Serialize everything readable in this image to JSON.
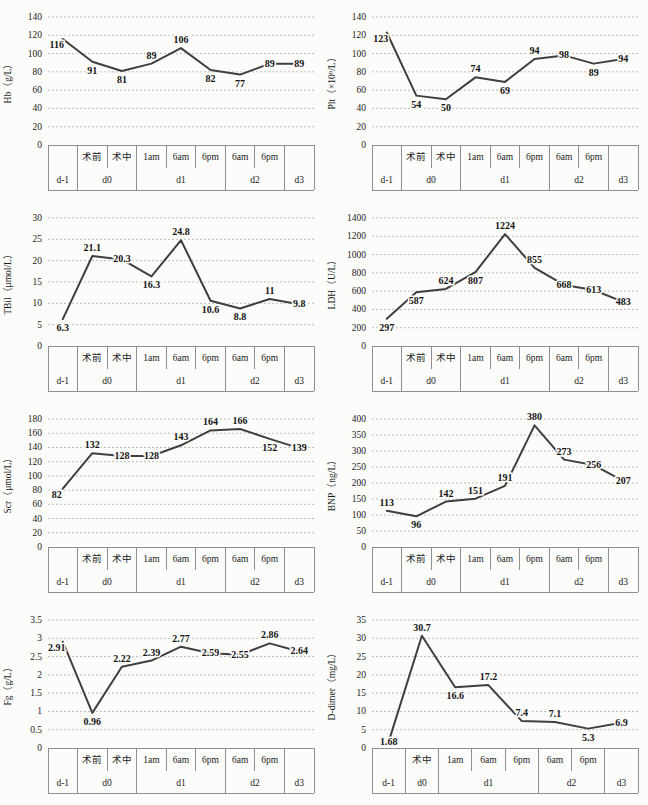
{
  "page": {
    "background": "#fcfcfa",
    "line_color": "#3f3f3f",
    "grid_color": "#bdbdbd",
    "table_line_color": "#8f8f8f",
    "text_color": "#1b1b1b"
  },
  "chart_data": [
    {
      "id": "hb",
      "type": "line",
      "title": "",
      "xlabel": "",
      "ylabel": "Hb（g/L）",
      "ylim": [
        0,
        140
      ],
      "ytick_step": 20,
      "grid": "horizontal-dashed",
      "legend": "none",
      "x_time": [
        "",
        "术前",
        "术中",
        "1am",
        "6am",
        "6pm",
        "6am",
        "6pm",
        ""
      ],
      "x_day": [
        {
          "label": "d-1",
          "span": 1
        },
        {
          "label": "d0",
          "span": 2
        },
        {
          "label": "d1",
          "span": 3
        },
        {
          "label": "d2",
          "span": 2
        },
        {
          "label": "d3",
          "span": 1
        }
      ],
      "values": [
        116,
        91,
        81,
        89,
        106,
        82,
        77,
        89,
        89
      ],
      "point_labels": [
        "116",
        "91",
        "81",
        "89",
        "106",
        "82",
        "77",
        "89",
        "89"
      ],
      "label_side": [
        "left",
        "below",
        "below",
        "above",
        "above",
        "below",
        "below",
        "on",
        "on"
      ]
    },
    {
      "id": "plt",
      "type": "line",
      "title": "",
      "xlabel": "",
      "ylabel": "Plt（×10⁹/L）",
      "ylim": [
        0,
        140
      ],
      "ytick_step": 20,
      "grid": "horizontal-dashed",
      "legend": "none",
      "x_time": [
        "",
        "术前",
        "术中",
        "1am",
        "6am",
        "6pm",
        "6am",
        "6pm",
        ""
      ],
      "x_day": [
        {
          "label": "d-1",
          "span": 1
        },
        {
          "label": "d0",
          "span": 2
        },
        {
          "label": "d1",
          "span": 3
        },
        {
          "label": "d2",
          "span": 2
        },
        {
          "label": "d3",
          "span": 1
        }
      ],
      "values": [
        123,
        54,
        50,
        74,
        69,
        94,
        98,
        89,
        94
      ],
      "point_labels": [
        "123",
        "54",
        "50",
        "74",
        "69",
        "94",
        "98",
        "89",
        "94"
      ],
      "label_side": [
        "left",
        "below",
        "below",
        "above",
        "below",
        "above",
        "on",
        "below",
        "on"
      ]
    },
    {
      "id": "tbil",
      "type": "line",
      "title": "",
      "xlabel": "",
      "ylabel": "TBil（μmol/L）",
      "ylim": [
        0,
        30
      ],
      "ytick_step": 5,
      "grid": "horizontal-dashed",
      "legend": "none",
      "x_time": [
        "",
        "术前",
        "术中",
        "1am",
        "6am",
        "6pm",
        "6am",
        "6pm",
        ""
      ],
      "x_day": [
        {
          "label": "d-1",
          "span": 1
        },
        {
          "label": "d0",
          "span": 2
        },
        {
          "label": "d1",
          "span": 3
        },
        {
          "label": "d2",
          "span": 2
        },
        {
          "label": "d3",
          "span": 1
        }
      ],
      "values": [
        6.3,
        21.1,
        20.3,
        16.3,
        24.8,
        10.6,
        8.8,
        11,
        9.8
      ],
      "point_labels": [
        "6.3",
        "21.1",
        "20.3",
        "16.3",
        "24.8",
        "10.6",
        "8.8",
        "11",
        "9.8"
      ],
      "label_side": [
        "below",
        "above",
        "on",
        "below",
        "above",
        "below",
        "below",
        "above",
        "on"
      ]
    },
    {
      "id": "ldh",
      "type": "line",
      "title": "",
      "xlabel": "",
      "ylabel": "LDH（U/L）",
      "ylim": [
        0,
        1400
      ],
      "ytick_step": 200,
      "grid": "horizontal-dashed",
      "legend": "none",
      "x_time": [
        "",
        "术前",
        "术中",
        "1am",
        "6am",
        "6pm",
        "6am",
        "6pm",
        ""
      ],
      "x_day": [
        {
          "label": "d-1",
          "span": 1
        },
        {
          "label": "d0",
          "span": 2
        },
        {
          "label": "d1",
          "span": 3
        },
        {
          "label": "d2",
          "span": 2
        },
        {
          "label": "d3",
          "span": 1
        }
      ],
      "values": [
        297,
        587,
        624,
        807,
        1224,
        855,
        668,
        613,
        483
      ],
      "point_labels": [
        "297",
        "587",
        "624",
        "807",
        "1224",
        "855",
        "668",
        "613",
        "483"
      ],
      "label_side": [
        "below",
        "below",
        "above",
        "below",
        "above",
        "above",
        "on",
        "on",
        "on"
      ]
    },
    {
      "id": "scr",
      "type": "line",
      "title": "",
      "xlabel": "",
      "ylabel": "Scr（μmol/L）",
      "ylim": [
        0,
        180
      ],
      "ytick_step": 20,
      "grid": "horizontal-dashed",
      "legend": "none",
      "x_time": [
        "",
        "术前",
        "术中",
        "1am",
        "6am",
        "6pm",
        "6am",
        "6pm",
        ""
      ],
      "x_day": [
        {
          "label": "d-1",
          "span": 1
        },
        {
          "label": "d0",
          "span": 2
        },
        {
          "label": "d1",
          "span": 3
        },
        {
          "label": "d2",
          "span": 2
        },
        {
          "label": "d3",
          "span": 1
        }
      ],
      "values": [
        82,
        132,
        128,
        128,
        143,
        164,
        166,
        152,
        139
      ],
      "point_labels": [
        "82",
        "132",
        "128",
        "128",
        "143",
        "164",
        "166",
        "152",
        "139"
      ],
      "label_side": [
        "left",
        "above",
        "on",
        "on",
        "above",
        "above",
        "above",
        "below",
        "on"
      ]
    },
    {
      "id": "bnp",
      "type": "line",
      "title": "",
      "xlabel": "",
      "ylabel": "BNP（ng/L）",
      "ylim": [
        0,
        400
      ],
      "ytick_step": 50,
      "grid": "horizontal-dashed",
      "legend": "none",
      "x_time": [
        "",
        "术前",
        "术中",
        "1am",
        "6am",
        "6pm",
        "6am",
        "6pm",
        ""
      ],
      "x_day": [
        {
          "label": "d-1",
          "span": 1
        },
        {
          "label": "d0",
          "span": 2
        },
        {
          "label": "d1",
          "span": 3
        },
        {
          "label": "d2",
          "span": 2
        },
        {
          "label": "d3",
          "span": 1
        }
      ],
      "values": [
        113,
        96,
        142,
        151,
        191,
        380,
        273,
        256,
        207
      ],
      "point_labels": [
        "113",
        "96",
        "142",
        "151",
        "191",
        "380",
        "273",
        "256",
        "207"
      ],
      "label_side": [
        "above",
        "below",
        "above",
        "above",
        "above",
        "above",
        "above",
        "on",
        "on"
      ]
    },
    {
      "id": "fg",
      "type": "line",
      "title": "",
      "xlabel": "",
      "ylabel": "Fg（g/L）",
      "ylim": [
        0,
        3.5
      ],
      "ytick_step": 0.5,
      "grid": "horizontal-dashed",
      "legend": "none",
      "x_time": [
        "",
        "术前",
        "术中",
        "1am",
        "6am",
        "6pm",
        "6am",
        "6pm",
        ""
      ],
      "x_day": [
        {
          "label": "d-1",
          "span": 1
        },
        {
          "label": "d0",
          "span": 2
        },
        {
          "label": "d1",
          "span": 3
        },
        {
          "label": "d2",
          "span": 2
        },
        {
          "label": "d3",
          "span": 1
        }
      ],
      "values": [
        2.91,
        0.96,
        2.22,
        2.39,
        2.77,
        2.59,
        2.55,
        2.86,
        2.64
      ],
      "point_labels": [
        "2.91",
        "0.96",
        "2.22",
        "2.39",
        "2.77",
        "2.59",
        "2.55",
        "2.86",
        "2.64"
      ],
      "label_side": [
        "left",
        "below",
        "above",
        "above",
        "above",
        "on",
        "on",
        "above",
        "on"
      ]
    },
    {
      "id": "d-dimer",
      "type": "line",
      "title": "",
      "xlabel": "",
      "ylabel": "D-dimer（mg/L）",
      "ylim": [
        0,
        35
      ],
      "ytick_step": 5,
      "grid": "horizontal-dashed",
      "legend": "none",
      "x_time": [
        "",
        "术中",
        "1am",
        "6am",
        "6pm",
        "6am",
        "6pm",
        ""
      ],
      "x_day": [
        {
          "label": "d-1",
          "span": 1
        },
        {
          "label": "d0",
          "span": 1
        },
        {
          "label": "d1",
          "span": 3
        },
        {
          "label": "d2",
          "span": 2
        },
        {
          "label": "d3",
          "span": 1
        }
      ],
      "values": [
        1.68,
        30.7,
        16.6,
        17.2,
        7.4,
        7.1,
        5.3,
        6.9
      ],
      "point_labels": [
        "1.68",
        "30.7",
        "16.6",
        "17.2",
        "7.4",
        "7.1",
        "5.3",
        "6.9"
      ],
      "label_side": [
        "below",
        "above",
        "below",
        "above",
        "above",
        "above",
        "below",
        "on"
      ]
    }
  ]
}
